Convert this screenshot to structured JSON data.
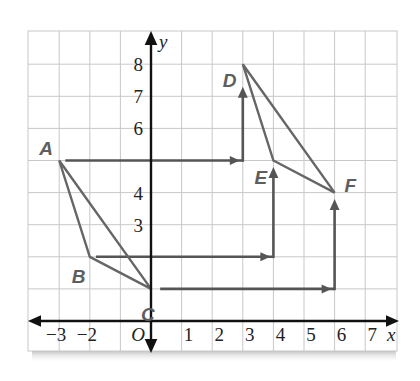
{
  "figure": {
    "type": "coordinate-grid-translation",
    "axes": {
      "x_label": "x",
      "y_label": "y",
      "origin_label": "O",
      "x_ticks": [
        {
          "value": -3,
          "label": "−3"
        },
        {
          "value": -2,
          "label": "−2"
        },
        {
          "value": 1,
          "label": "1"
        },
        {
          "value": 2,
          "label": "2"
        },
        {
          "value": 3,
          "label": "3"
        },
        {
          "value": 4,
          "label": "4"
        },
        {
          "value": 5,
          "label": "5"
        },
        {
          "value": 6,
          "label": "6"
        },
        {
          "value": 7,
          "label": "7"
        }
      ],
      "y_ticks": [
        {
          "value": 8,
          "label": "8"
        },
        {
          "value": 7,
          "label": "7"
        },
        {
          "value": 6,
          "label": "6"
        },
        {
          "value": 4,
          "label": "4"
        },
        {
          "value": 3,
          "label": "3"
        }
      ],
      "x_range": [
        -4,
        8
      ],
      "y_range": [
        -0.94,
        9
      ]
    },
    "points": {
      "A": {
        "label": "A",
        "x": -3,
        "y": 5
      },
      "B": {
        "label": "B",
        "x": -2,
        "y": 2
      },
      "C": {
        "label": "C",
        "x": 0,
        "y": 1
      },
      "D": {
        "label": "D",
        "x": 3,
        "y": 8
      },
      "E": {
        "label": "E",
        "x": 4,
        "y": 5
      },
      "F": {
        "label": "F",
        "x": 6,
        "y": 4
      }
    },
    "triangles": [
      {
        "name": "ABC",
        "vertices": [
          "A",
          "B",
          "C"
        ]
      },
      {
        "name": "DEF",
        "vertices": [
          "D",
          "E",
          "F"
        ]
      }
    ],
    "translation_paths": [
      {
        "from": "A",
        "to": "D",
        "corner": [
          3,
          5
        ],
        "horizontal_start": [
          -2.8,
          5
        ],
        "vertical_end": [
          3,
          7.3
        ]
      },
      {
        "from": "B",
        "to": "E",
        "corner": [
          4,
          2
        ],
        "horizontal_start": [
          -1.8,
          2
        ],
        "vertical_end": [
          4,
          4.8
        ]
      },
      {
        "from": "C",
        "to": "F",
        "corner": [
          6,
          1
        ],
        "horizontal_start": [
          0.3,
          1
        ],
        "vertical_end": [
          6,
          3.8
        ]
      }
    ],
    "colors": {
      "grid": "#c8c8c8",
      "axis": "#111111",
      "shape": "#666666",
      "arrow": "#555555",
      "label": "#5e5e5e"
    }
  }
}
